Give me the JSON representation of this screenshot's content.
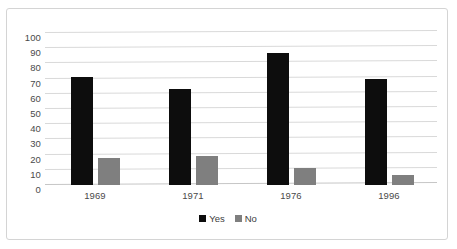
{
  "chart_data": {
    "type": "bar",
    "title": "",
    "subtitle": "",
    "xlabel": "",
    "ylabel": "",
    "categories": [
      "1969",
      "1971",
      "1976",
      "1996"
    ],
    "series": [
      {
        "name": "Yes",
        "color": "#0d0d0d",
        "values": [
          71,
          63,
          87,
          70
        ]
      },
      {
        "name": "No",
        "color": "#7f7f7f",
        "values": [
          17.5,
          19,
          11,
          6.5
        ]
      }
    ],
    "ylim": [
      0,
      100
    ],
    "yticks": [
      0,
      10,
      20,
      30,
      40,
      50,
      60,
      70,
      80,
      90,
      100
    ],
    "ytick_labels": [
      "0",
      "10",
      "20",
      "30",
      "40",
      "50",
      "60",
      "70",
      "80",
      "90",
      "100"
    ],
    "grid": true,
    "legend_position": "bottom",
    "legend_entries": [
      "Yes",
      "No"
    ],
    "border_color": "#d4d4d4",
    "gridline_color": "#d9d9d9",
    "background": "#ffffff"
  }
}
